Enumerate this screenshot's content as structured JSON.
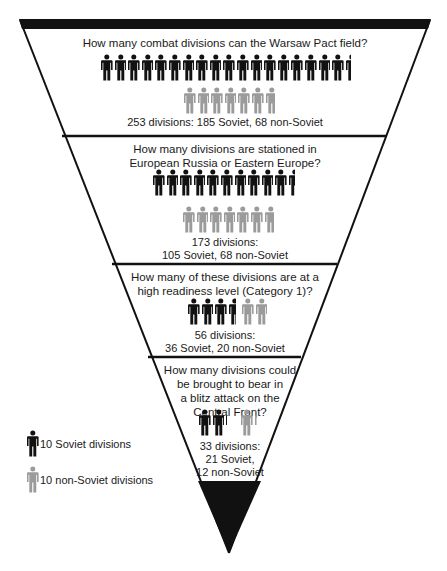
{
  "colors": {
    "soviet": "#111111",
    "non_soviet": "#9b9b9b",
    "outline": "#111111",
    "background": "#ffffff"
  },
  "icons": {
    "soviet": "person-figure-icon-black",
    "non_soviet": "person-figure-icon-gray"
  },
  "sections": [
    {
      "question": "How many combat divisions can the Warsaw Pact field?",
      "summary": "253 divisions: 185 Soviet, 68 non-Soviet",
      "total": 253,
      "soviet": 185,
      "non_soviet": 68,
      "soviet_icons": 18.5,
      "non_soviet_icons": 6.8
    },
    {
      "question_line1": "How many divisions are stationed in",
      "question_line2": "European Russia or Eastern Europe?",
      "summary_line1": "173 divisions:",
      "summary_line2": "105 Soviet, 68 non-Soviet",
      "total": 173,
      "soviet": 105,
      "non_soviet": 68,
      "soviet_icons": 10.5,
      "non_soviet_icons": 6.8
    },
    {
      "question_line1": "How many of these divisions are at a",
      "question_line2": "high readiness level (Category 1)?",
      "summary_line1": "56 divisions:",
      "summary_line2": "36 Soviet, 20 non-Soviet",
      "total": 56,
      "soviet": 36,
      "non_soviet": 20,
      "soviet_icons": 3.6,
      "non_soviet_icons": 2.0
    },
    {
      "question_line1": "How many divisions could",
      "question_line2": "be brought to bear in",
      "question_line3": "a blitz attack on the",
      "question_line4": "Central Front?",
      "summary_line1": "33 divisions:",
      "summary_line2": "21 Soviet,",
      "summary_line3": "12 non-Soviet",
      "total": 33,
      "soviet": 21,
      "non_soviet": 12,
      "soviet_icons": 2.1,
      "non_soviet_icons": 1.2
    }
  ],
  "legend": {
    "soviet_label": "10 Soviet divisions",
    "non_soviet_label": "10 non-Soviet divisions"
  }
}
